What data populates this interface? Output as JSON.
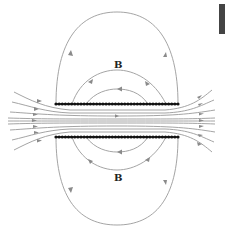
{
  "diagram": {
    "labels": {
      "top_field": "B",
      "bottom_field": "B"
    },
    "colors": {
      "field_line": "#9a9a9a",
      "arrow": "#8a8a8a",
      "coil_wire": "#111111",
      "label": "#222222",
      "corner_block": "#444444"
    },
    "coil": {
      "top_y": 104,
      "bottom_y": 137,
      "x_start": 56,
      "x_end": 178,
      "wire_count": 40
    }
  }
}
